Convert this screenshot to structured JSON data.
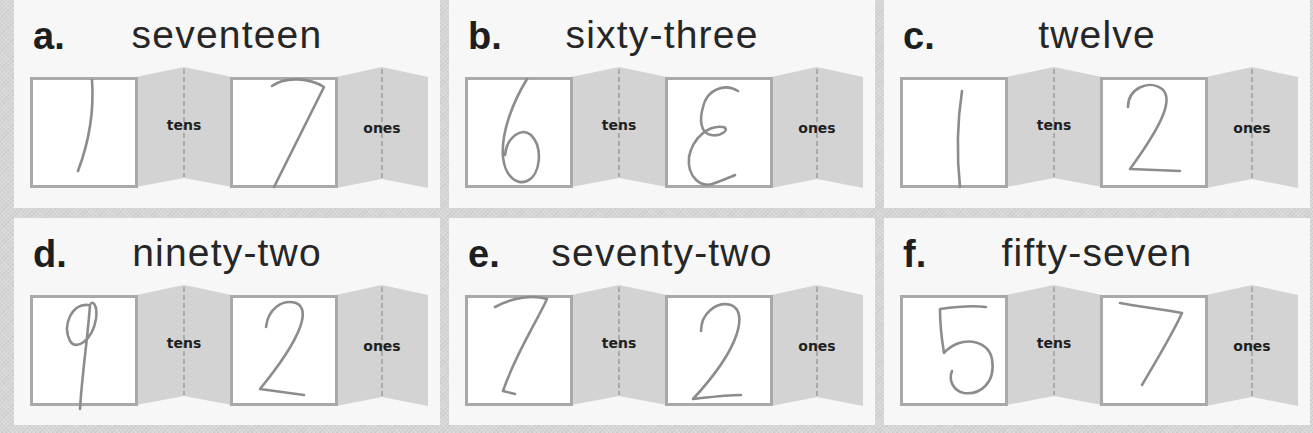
{
  "worksheet": {
    "place_labels": {
      "tens": "tens",
      "ones": "ones"
    },
    "problems": [
      {
        "letter": "a.",
        "word": "seventeen",
        "tens": {
          "digit": "1",
          "stroke": "M62 3 C64 30 60 62 48 94"
        },
        "ones": {
          "digit": "7",
          "stroke": "M42 9 C56 -1 80 1 94 10 L44 110"
        }
      },
      {
        "letter": "b.",
        "word": "sixty-three",
        "tens": {
          "digit": "6",
          "stroke": "M62 2 C48 25 36 55 38 80 C40 100 52 108 62 104 C76 98 78 70 66 58 C56 50 42 60 40 78"
        },
        "ones": {
          "digit": "3 (written reversed as Ɛ)",
          "stroke": "M73 14 C60 6 42 12 38 30 C34 44 36 56 46 58 C56 60 66 52 58 50 C44 48 28 60 24 80 C22 100 36 112 50 106 C60 102 66 100 70 98"
        }
      },
      {
        "letter": "c.",
        "word": "twelve",
        "tens": {
          "digit": "1",
          "stroke": "M62 14 C58 40 56 72 60 110"
        },
        "ones": {
          "digit": "2",
          "stroke": "M28 30 C28 12 48 2 62 12 C74 22 62 48 30 92 L80 94"
        }
      },
      {
        "letter": "d.",
        "word": "ninety-two",
        "tens": {
          "digit": "9",
          "stroke": "M58 10 C42 8 32 30 40 46 C46 56 62 46 66 24 C68 10 62 4 60 10 C58 40 52 80 50 114"
        },
        "ones": {
          "digit": "2",
          "stroke": "M36 32 C38 14 52 4 66 8 C80 14 74 40 30 94 C44 96 60 98 74 100"
        }
      },
      {
        "letter": "e.",
        "word": "seventy-two",
        "tens": {
          "digit": "7",
          "stroke": "M30 12 C48 2 68 0 82 4 C70 30 50 60 38 96 L50 99"
        },
        "ones": {
          "digit": "2",
          "stroke": "M36 36 C36 18 52 6 66 10 C82 16 78 50 28 104 C46 102 62 100 76 100"
        }
      },
      {
        "letter": "f.",
        "word": "fifty-seven",
        "tens": {
          "digit": "5",
          "stroke": "M86 12 C70 10 54 12 40 14 C40 30 42 46 44 58 C60 40 88 44 92 64 C96 88 80 100 64 98 C54 96 48 86 52 76"
        },
        "ones": {
          "digit": "7",
          "stroke": "M20 8 C40 12 62 14 82 18 C72 40 56 66 42 90"
        }
      }
    ]
  },
  "colors": {
    "page_background": "#d6d6d6",
    "panel_background": "#f7f7f7",
    "box_border": "#a9a9a9",
    "fold_fill": "#d3d3d3",
    "handwriting": "#8c8c8c",
    "text": "#1e1e1e"
  }
}
